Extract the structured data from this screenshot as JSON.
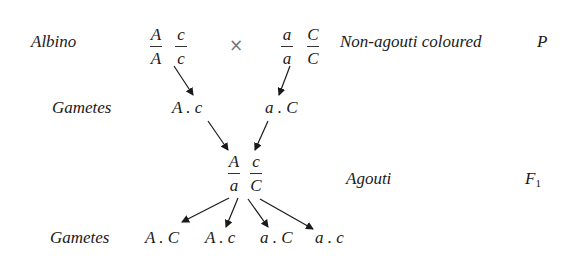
{
  "parents": {
    "left_label": "Albino",
    "left_genotype": {
      "gene1": {
        "top": "A",
        "bottom": "A"
      },
      "gene2": {
        "top": "c",
        "bottom": "c"
      }
    },
    "cross_symbol": "×",
    "right_genotype": {
      "gene1": {
        "top": "a",
        "bottom": "a"
      },
      "gene2": {
        "top": "C",
        "bottom": "C"
      }
    },
    "right_label": "Non-agouti coloured",
    "generation": "P"
  },
  "parent_gametes": {
    "label": "Gametes",
    "left": "A . c",
    "right": "a . C"
  },
  "f1": {
    "genotype": {
      "gene1": {
        "top": "A",
        "bottom": "a"
      },
      "gene2": {
        "top": "c",
        "bottom": "C"
      }
    },
    "phenotype": "Agouti",
    "generation_letter": "F",
    "generation_sub": "1"
  },
  "f1_gametes": {
    "label": "Gametes",
    "items": [
      "A . C",
      "A . c",
      "a . C",
      "a . c"
    ]
  }
}
